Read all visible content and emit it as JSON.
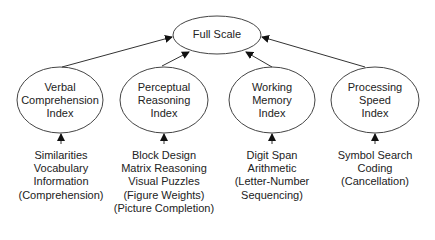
{
  "diagram": {
    "root": {
      "id": "full-scale",
      "label": "Full Scale"
    },
    "indices": [
      {
        "id": "verbal-comprehension-index",
        "label_lines": [
          "Verbal",
          "Comprehension",
          "Index"
        ],
        "subtests": [
          "Similarities",
          "Vocabulary",
          "Information",
          "(Comprehension)"
        ]
      },
      {
        "id": "perceptual-reasoning-index",
        "label_lines": [
          "Perceptual",
          "Reasoning",
          "Index"
        ],
        "subtests": [
          "Block Design",
          "Matrix Reasoning",
          "Visual Puzzles",
          "(Figure Weights)",
          "(Picture Completion)"
        ]
      },
      {
        "id": "working-memory-index",
        "label_lines": [
          "Working",
          "Memory",
          "Index"
        ],
        "subtests": [
          "Digit Span",
          "Arithmetic",
          "(Letter-Number",
          "Sequencing)"
        ]
      },
      {
        "id": "processing-speed-index",
        "label_lines": [
          "Processing",
          "Speed",
          "Index"
        ],
        "subtests": [
          "Symbol Search",
          "Coding",
          "(Cancellation)"
        ]
      }
    ],
    "edges": [
      {
        "from": "verbal-comprehension-index",
        "to": "full-scale"
      },
      {
        "from": "perceptual-reasoning-index",
        "to": "full-scale"
      },
      {
        "from": "working-memory-index",
        "to": "full-scale"
      },
      {
        "from": "processing-speed-index",
        "to": "full-scale"
      },
      {
        "from": "subtests-verbal",
        "to": "verbal-comprehension-index"
      },
      {
        "from": "subtests-perceptual",
        "to": "perceptual-reasoning-index"
      },
      {
        "from": "subtests-working",
        "to": "working-memory-index"
      },
      {
        "from": "subtests-processing",
        "to": "processing-speed-index"
      }
    ],
    "colors": {
      "stroke": "#333333",
      "text": "#222222",
      "background": "#ffffff"
    }
  }
}
